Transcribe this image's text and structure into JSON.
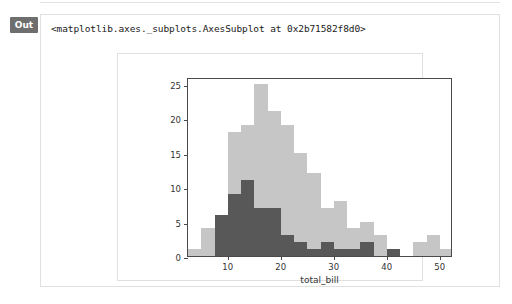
{
  "notebook": {
    "out_label": "Out",
    "repr_text": "<matplotlib.axes._subplots.AxesSubplot at 0x2b71582f8d0>"
  },
  "colors": {
    "series_light": "#c6c6c6",
    "series_dark": "#585858",
    "axis": "#4a4a4a",
    "badge_bg": "#6e6e6e",
    "panel_border": "#e0e0e0"
  },
  "chart_data": {
    "type": "bar",
    "title": "",
    "xlabel": "total_bill",
    "ylabel": "",
    "xlim": [
      2.5,
      52.5
    ],
    "ylim": [
      0,
      26
    ],
    "xticks": [
      10,
      20,
      30,
      40,
      50
    ],
    "yticks": [
      0,
      5,
      10,
      15,
      20,
      25
    ],
    "grid": false,
    "legend": "none",
    "bin_width": 2.5,
    "bin_starts": [
      2.5,
      5.0,
      7.5,
      10.0,
      12.5,
      15.0,
      17.5,
      20.0,
      22.5,
      25.0,
      27.5,
      30.0,
      32.5,
      35.0,
      37.5,
      40.0,
      42.5,
      45.0,
      47.5,
      50.0
    ],
    "series": [
      {
        "name": "all",
        "color": "#c6c6c6",
        "values": [
          1,
          4,
          6,
          18,
          19,
          25,
          21,
          19,
          15,
          12,
          7,
          8,
          4,
          5,
          3,
          1,
          0,
          2,
          3,
          1
        ]
      },
      {
        "name": "subset",
        "color": "#585858",
        "values": [
          0,
          0,
          6,
          9,
          11,
          7,
          7,
          3,
          2,
          1,
          2,
          1,
          1,
          2,
          0,
          1,
          0,
          0,
          0,
          0
        ]
      }
    ]
  }
}
